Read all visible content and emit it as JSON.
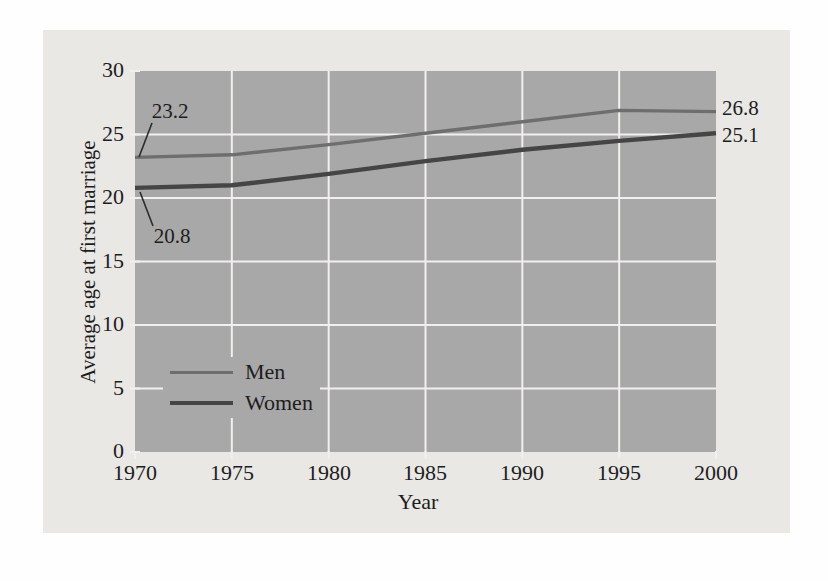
{
  "figure": {
    "page_color": "#fefefe",
    "background_color": "#e9e8e5",
    "plot_background_color": "#a8a8a8",
    "gridline_color": "#f1f0ee",
    "text_color": "#1d1d1d",
    "leader_line_color": "#2b2b2b"
  },
  "chart_data": {
    "type": "line",
    "title": "",
    "xlabel": "Year",
    "ylabel": "Average age at first marriage",
    "x": [
      1970,
      1975,
      1980,
      1985,
      1990,
      1995,
      2000
    ],
    "xlim": [
      1970,
      2000
    ],
    "ylim": [
      0,
      30
    ],
    "yticks": [
      0,
      5,
      10,
      15,
      20,
      25,
      30
    ],
    "grid": true,
    "legend_position": "inside-lower-left",
    "series": [
      {
        "name": "Men",
        "color": "#6e6e6e",
        "line_width": 3.4,
        "values": [
          23.2,
          23.4,
          24.2,
          25.1,
          26.0,
          26.9,
          26.8
        ]
      },
      {
        "name": "Women",
        "color": "#454545",
        "line_width": 4.4,
        "values": [
          20.8,
          21.0,
          21.9,
          22.9,
          23.8,
          24.5,
          25.1
        ]
      }
    ],
    "annotations": [
      {
        "text": "23.2",
        "refers_to": "Men 1970"
      },
      {
        "text": "20.8",
        "refers_to": "Women 1970"
      },
      {
        "text": "26.8",
        "refers_to": "Men 2000"
      },
      {
        "text": "25.1",
        "refers_to": "Women 2000"
      }
    ]
  }
}
